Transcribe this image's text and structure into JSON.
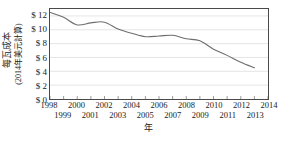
{
  "chart_data": {
    "type": "line",
    "title": "",
    "subtitle": "",
    "xlabel": "年",
    "ylabel_line1": "每瓦成本",
    "ylabel_line2": "(2014年美元計算)",
    "ylabel": "每瓦成本 (2014年美元計算)",
    "grid": true,
    "legend": "none",
    "xlim": [
      1998,
      2014
    ],
    "ylim": [
      0,
      13
    ],
    "yticks": [
      0,
      2,
      4,
      6,
      8,
      10,
      12
    ],
    "ytick_labels": [
      "$ 0",
      "$ 2",
      "$ 4",
      "$ 6",
      "$ 8",
      "$ 10",
      "$ 12"
    ],
    "xticks": [
      1998,
      1999,
      2000,
      2001,
      2002,
      2003,
      2004,
      2005,
      2006,
      2007,
      2008,
      2009,
      2010,
      2011,
      2012,
      2013,
      2014
    ],
    "xtick_labels_top": [
      "1998",
      "2000",
      "2002",
      "2004",
      "2006",
      "2008",
      "2010",
      "2012",
      "2014"
    ],
    "xtick_labels_bottom": [
      "1999",
      "2001",
      "2003",
      "2005",
      "2007",
      "2009",
      "2011",
      "2013"
    ],
    "line_color": "#6e6e6e",
    "x": [
      1998,
      1999,
      2000,
      2001,
      2002,
      2003,
      2004,
      2005,
      2006,
      2007,
      2008,
      2009,
      2010,
      2011,
      2012,
      2013
    ],
    "values": [
      12.5,
      11.8,
      10.7,
      11.0,
      11.1,
      10.1,
      9.5,
      9.0,
      9.1,
      9.2,
      8.7,
      8.4,
      7.2,
      6.3,
      5.3,
      4.5
    ],
    "series": [
      {
        "name": "每瓦成本",
        "values": [
          12.5,
          11.8,
          10.7,
          11.0,
          11.1,
          10.1,
          9.5,
          9.0,
          9.1,
          9.2,
          8.7,
          8.4,
          7.2,
          6.3,
          5.3,
          4.5
        ]
      }
    ]
  }
}
